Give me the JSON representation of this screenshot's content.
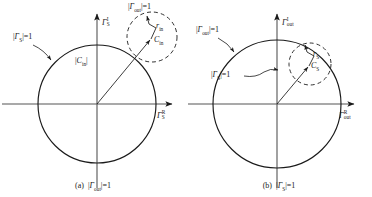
{
  "figure": {
    "type": "technical-diagram",
    "panels": [
      {
        "id": "a",
        "caption_prefix": "(a)",
        "caption_math": "|Γout|=1",
        "caption_symbol": "Γ",
        "caption_sub": "out",
        "axis_vertical": {
          "symbol": "Γ",
          "sup": "I",
          "sub": "S"
        },
        "axis_horizontal": {
          "symbol": "Γ",
          "sup": "R",
          "sub": "S"
        },
        "unit_circle_label": {
          "symbol": "Γ",
          "sub": "S",
          "text": "|ΓS|=1"
        },
        "dashed_circle_label": {
          "symbol": "Γ",
          "sub": "out",
          "text": "|Γout|=1"
        },
        "center_vector_label": {
          "symbol": "C",
          "sub": "in",
          "text": "|Cin|"
        },
        "radius_label": {
          "symbol": "r",
          "sub": "in",
          "text": "rin"
        },
        "center_point_label": {
          "symbol": "C",
          "sub": "in",
          "text": "Cin"
        },
        "geometry": {
          "origin": [
            97,
            104
          ],
          "unit_radius": 59,
          "dashed_center": [
            152,
            37
          ],
          "dashed_radius": 25,
          "radius_arrow_from": [
            152,
            37
          ],
          "radius_arrow_to": [
            146,
            14
          ]
        }
      },
      {
        "id": "b",
        "caption_prefix": "(b)",
        "caption_math": "|ΓS|=1",
        "caption_symbol": "Γ",
        "caption_sub": "S",
        "axis_vertical": {
          "symbol": "Γ",
          "sup": "I",
          "sub": "out"
        },
        "axis_horizontal": {
          "symbol": "Γ",
          "sup": "R",
          "sub": "out"
        },
        "unit_circle_label": {
          "symbol": "Γ",
          "sub": "out",
          "text": "|Γout|=1"
        },
        "dashed_circle_label": {
          "symbol": "Γ",
          "sub": "S",
          "text": "|ΓS|=1"
        },
        "radius_label": {
          "symbol": "r",
          "sub": "S",
          "text": "rS"
        },
        "center_point_label": {
          "symbol": "C",
          "sub": "S",
          "text": "CS"
        },
        "geometry": {
          "origin": [
            91,
            104
          ],
          "unit_radius": 64,
          "dashed_center": [
            124,
            64
          ],
          "dashed_radius": 21,
          "radius_arrow_from": [
            124,
            64
          ],
          "radius_arrow_to": [
            117,
            47
          ]
        }
      }
    ],
    "style": {
      "stroke": "#1a1a1a",
      "axis_color": "#555555",
      "background": "#ffffff",
      "solid_circle_width": 1.1,
      "dashed_circle_width": 0.9,
      "dash_pattern": "4,3"
    }
  }
}
